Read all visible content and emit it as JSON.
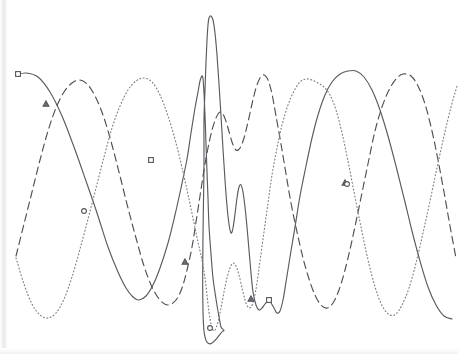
{
  "figure": {
    "title": "",
    "background_color": "#ffffff",
    "width": 458,
    "height": 354
  },
  "chart_data": {
    "type": "line",
    "title": "",
    "subtitle": "",
    "xlabel": "",
    "ylabel": "",
    "xlim": [
      0,
      458
    ],
    "ylim": [
      354,
      0
    ],
    "grid": false,
    "axes_visible": false,
    "tick_labels_x": [],
    "tick_labels_y": [],
    "legend": {
      "visible": false,
      "position": "none",
      "entries": []
    },
    "annotations": [],
    "series": [
      {
        "name": "series-1",
        "linestyle": "solid",
        "color": "#5a5a60",
        "width": 1.15,
        "marker": "square",
        "marker_points": [
          [
            18,
            74
          ],
          [
            151,
            160
          ],
          [
            269,
            300
          ]
        ],
        "points": [
          [
            16,
            75
          ],
          [
            26,
            73
          ],
          [
            38,
            77
          ],
          [
            50,
            92
          ],
          [
            62,
            116
          ],
          [
            74,
            147
          ],
          [
            86,
            181
          ],
          [
            97,
            213
          ],
          [
            108,
            247
          ],
          [
            118,
            272
          ],
          [
            126,
            288
          ],
          [
            133,
            297
          ],
          [
            139,
            300
          ],
          [
            146,
            296
          ],
          [
            153,
            285
          ],
          [
            160,
            268
          ],
          [
            168,
            243
          ],
          [
            175,
            215
          ],
          [
            181,
            188
          ],
          [
            187,
            159
          ],
          [
            191,
            133
          ],
          [
            195,
            108
          ],
          [
            198,
            92
          ],
          [
            200,
            81
          ],
          [
            202,
            76
          ],
          [
            203,
            79
          ],
          [
            204,
            93
          ],
          [
            205,
            115
          ],
          [
            206,
            144
          ],
          [
            207,
            172
          ],
          [
            208,
            198
          ],
          [
            209,
            226
          ],
          [
            211,
            254
          ],
          [
            213,
            278
          ],
          [
            216,
            299
          ],
          [
            219,
            317
          ],
          [
            221,
            327
          ],
          [
            223,
            331
          ],
          [
            204,
            331
          ],
          [
            204,
            160
          ],
          [
            204,
            120
          ],
          [
            205,
            90
          ],
          [
            206,
            62
          ],
          [
            207,
            40
          ],
          [
            208,
            25
          ],
          [
            209,
            18
          ],
          [
            211,
            16
          ],
          [
            213,
            20
          ],
          [
            215,
            33
          ],
          [
            217,
            55
          ],
          [
            219,
            84
          ],
          [
            221,
            116
          ],
          [
            223,
            149
          ],
          [
            225,
            180
          ],
          [
            227,
            206
          ],
          [
            229,
            224
          ],
          [
            231,
            233
          ],
          [
            233,
            228
          ],
          [
            235,
            214
          ],
          [
            237,
            198
          ],
          [
            239,
            187
          ],
          [
            241,
            185
          ],
          [
            243,
            192
          ],
          [
            245,
            207
          ],
          [
            247,
            227
          ],
          [
            249,
            250
          ],
          [
            251,
            273
          ],
          [
            253,
            292
          ],
          [
            256,
            305
          ],
          [
            259,
            310
          ],
          [
            262,
            308
          ],
          [
            265,
            304
          ],
          [
            268,
            301
          ],
          [
            271,
            303
          ],
          [
            274,
            308
          ],
          [
            277,
            313
          ],
          [
            280,
            311
          ],
          [
            283,
            300
          ],
          [
            286,
            282
          ],
          [
            290,
            257
          ],
          [
            295,
            227
          ],
          [
            300,
            196
          ],
          [
            306,
            166
          ],
          [
            312,
            138
          ],
          [
            318,
            115
          ],
          [
            325,
            95
          ],
          [
            332,
            82
          ],
          [
            340,
            74
          ],
          [
            348,
            71
          ],
          [
            356,
            71
          ],
          [
            364,
            77
          ],
          [
            372,
            90
          ],
          [
            380,
            110
          ],
          [
            388,
            136
          ],
          [
            396,
            166
          ],
          [
            404,
            198
          ],
          [
            412,
            231
          ],
          [
            420,
            261
          ],
          [
            428,
            287
          ],
          [
            436,
            305
          ],
          [
            444,
            316
          ],
          [
            452,
            319
          ]
        ]
      },
      {
        "name": "series-2",
        "linestyle": "dashed",
        "color": "#4f4f56",
        "width": 1.15,
        "marker": "triangle",
        "marker_points": [
          [
            46,
            104
          ],
          [
            185,
            262
          ],
          [
            251,
            299
          ],
          [
            345,
            183
          ]
        ],
        "points": [
          [
            16,
            256
          ],
          [
            24,
            224
          ],
          [
            32,
            192
          ],
          [
            40,
            160
          ],
          [
            48,
            131
          ],
          [
            56,
            108
          ],
          [
            64,
            92
          ],
          [
            72,
            83
          ],
          [
            80,
            80
          ],
          [
            88,
            85
          ],
          [
            96,
            98
          ],
          [
            104,
            118
          ],
          [
            112,
            145
          ],
          [
            120,
            176
          ],
          [
            128,
            208
          ],
          [
            136,
            238
          ],
          [
            144,
            266
          ],
          [
            152,
            287
          ],
          [
            160,
            300
          ],
          [
            168,
            305
          ],
          [
            176,
            300
          ],
          [
            182,
            288
          ],
          [
            187,
            270
          ],
          [
            192,
            247
          ],
          [
            196,
            222
          ],
          [
            200,
            196
          ],
          [
            204,
            170
          ],
          [
            208,
            148
          ],
          [
            212,
            130
          ],
          [
            216,
            118
          ],
          [
            220,
            112
          ],
          [
            224,
            116
          ],
          [
            228,
            128
          ],
          [
            232,
            142
          ],
          [
            236,
            150
          ],
          [
            240,
            148
          ],
          [
            244,
            138
          ],
          [
            248,
            122
          ],
          [
            252,
            104
          ],
          [
            256,
            88
          ],
          [
            260,
            78
          ],
          [
            264,
            75
          ],
          [
            268,
            80
          ],
          [
            272,
            94
          ],
          [
            276,
            116
          ],
          [
            281,
            144
          ],
          [
            286,
            174
          ],
          [
            291,
            203
          ],
          [
            297,
            232
          ],
          [
            303,
            258
          ],
          [
            309,
            279
          ],
          [
            315,
            295
          ],
          [
            321,
            305
          ],
          [
            327,
            308
          ],
          [
            333,
            303
          ],
          [
            339,
            290
          ],
          [
            345,
            270
          ],
          [
            351,
            245
          ],
          [
            357,
            217
          ],
          [
            363,
            188
          ],
          [
            369,
            159
          ],
          [
            375,
            131
          ],
          [
            382,
            107
          ],
          [
            389,
            90
          ],
          [
            396,
            79
          ],
          [
            403,
            74
          ],
          [
            411,
            76
          ],
          [
            418,
            86
          ],
          [
            425,
            104
          ],
          [
            432,
            131
          ],
          [
            438,
            160
          ],
          [
            444,
            192
          ],
          [
            450,
            226
          ],
          [
            456,
            258
          ]
        ]
      },
      {
        "name": "series-3",
        "linestyle": "dotted",
        "color": "#7d7d84",
        "width": 1.15,
        "marker": "circle",
        "marker_points": [
          [
            84,
            211
          ],
          [
            210,
            328
          ],
          [
            347,
            184
          ]
        ],
        "points": [
          [
            16,
            258
          ],
          [
            24,
            284
          ],
          [
            32,
            304
          ],
          [
            40,
            315
          ],
          [
            48,
            318
          ],
          [
            56,
            313
          ],
          [
            64,
            299
          ],
          [
            72,
            277
          ],
          [
            80,
            249
          ],
          [
            88,
            219
          ],
          [
            96,
            188
          ],
          [
            104,
            157
          ],
          [
            112,
            128
          ],
          [
            120,
            106
          ],
          [
            128,
            90
          ],
          [
            136,
            81
          ],
          [
            144,
            78
          ],
          [
            152,
            82
          ],
          [
            160,
            95
          ],
          [
            168,
            116
          ],
          [
            176,
            143
          ],
          [
            183,
            172
          ],
          [
            189,
            199
          ],
          [
            194,
            223
          ],
          [
            198,
            242
          ],
          [
            202,
            260
          ],
          [
            205,
            278
          ],
          [
            207,
            295
          ],
          [
            209,
            312
          ],
          [
            211,
            324
          ],
          [
            213,
            330
          ],
          [
            215,
            330
          ],
          [
            218,
            322
          ],
          [
            221,
            308
          ],
          [
            224,
            292
          ],
          [
            227,
            278
          ],
          [
            230,
            268
          ],
          [
            233,
            263
          ],
          [
            236,
            266
          ],
          [
            239,
            275
          ],
          [
            242,
            288
          ],
          [
            245,
            300
          ],
          [
            248,
            307
          ],
          [
            251,
            307
          ],
          [
            254,
            299
          ],
          [
            257,
            283
          ],
          [
            260,
            261
          ],
          [
            264,
            232
          ],
          [
            268,
            203
          ],
          [
            272,
            175
          ],
          [
            277,
            148
          ],
          [
            282,
            125
          ],
          [
            288,
            105
          ],
          [
            294,
            91
          ],
          [
            300,
            82
          ],
          [
            306,
            79
          ],
          [
            312,
            80
          ],
          [
            318,
            83
          ],
          [
            324,
            87
          ],
          [
            330,
            95
          ],
          [
            336,
            110
          ],
          [
            342,
            133
          ],
          [
            348,
            161
          ],
          [
            354,
            192
          ],
          [
            360,
            222
          ],
          [
            366,
            251
          ],
          [
            372,
            276
          ],
          [
            378,
            296
          ],
          [
            384,
            309
          ],
          [
            390,
            315
          ],
          [
            396,
            314
          ],
          [
            402,
            305
          ],
          [
            409,
            288
          ],
          [
            416,
            263
          ],
          [
            423,
            233
          ],
          [
            430,
            201
          ],
          [
            437,
            168
          ],
          [
            444,
            136
          ],
          [
            451,
            107
          ],
          [
            457,
            86
          ]
        ]
      }
    ]
  }
}
